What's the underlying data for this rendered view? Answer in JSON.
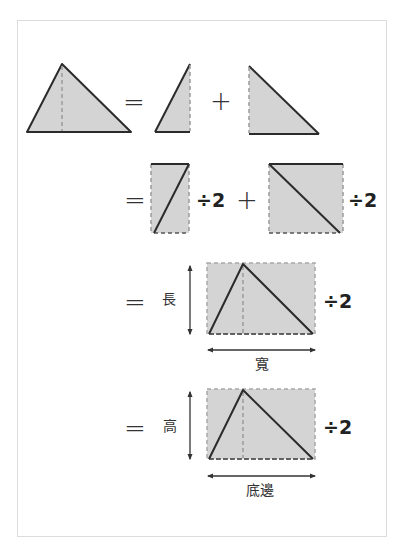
{
  "colors": {
    "fill": "#d4d4d4",
    "stroke": "#2b2b2b",
    "dash": "#9a9a9a",
    "frame": "#dcdcdc"
  },
  "rows": [
    {
      "id": "row1",
      "equals": "=",
      "plus": "+",
      "shapes": [
        "full-triangle-with-height-line",
        "left-right-triangle",
        "right-right-triangle"
      ]
    },
    {
      "id": "row2",
      "equals": "=",
      "plus": "+",
      "div_left": "÷2",
      "div_right": "÷2",
      "shapes": [
        "narrow-rectangle-with-diagonal",
        "wide-rectangle-with-diagonal"
      ]
    },
    {
      "id": "row3",
      "equals": "=",
      "vertical_label": "長",
      "horizontal_label": "寬",
      "div": "÷2",
      "shapes": [
        "rectangle-with-inscribed-triangle"
      ]
    },
    {
      "id": "row4",
      "equals": "=",
      "vertical_label": "高",
      "horizontal_label": "底邊",
      "div": "÷2",
      "shapes": [
        "rectangle-with-inscribed-triangle"
      ]
    }
  ]
}
